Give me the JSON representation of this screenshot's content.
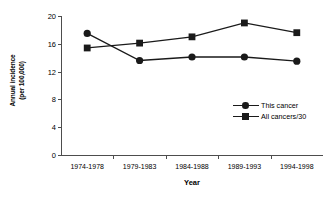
{
  "chart_data": {
    "type": "line",
    "title": "",
    "xlabel": "Year",
    "ylabel": "Annual incidence (per 100,000)",
    "ylabel_line1": "Annual incidence",
    "ylabel_line2": "(per 100,000)",
    "categories": [
      "1974-1978",
      "1979-1983",
      "1984-1988",
      "1989-1993",
      "1994-1998"
    ],
    "yticks": [
      20,
      16,
      12,
      8,
      4,
      0
    ],
    "ytick_labels": [
      "20",
      "16",
      "12",
      "8",
      "4",
      "0"
    ],
    "ylim": [
      0,
      20
    ],
    "grid": false,
    "legend_position": "inside-right",
    "series": [
      {
        "name": "This cancer",
        "marker": "circle",
        "color": "#1a1a1a",
        "values": [
          17.5,
          13.6,
          14.1,
          14.1,
          13.5
        ]
      },
      {
        "name": "All cancers/30",
        "marker": "square",
        "color": "#1a1a1a",
        "values": [
          15.4,
          16.1,
          17.0,
          19.0,
          17.6
        ]
      }
    ]
  },
  "legend": {
    "items": [
      {
        "label": "This cancer"
      },
      {
        "label": "All cancers/30"
      }
    ]
  }
}
